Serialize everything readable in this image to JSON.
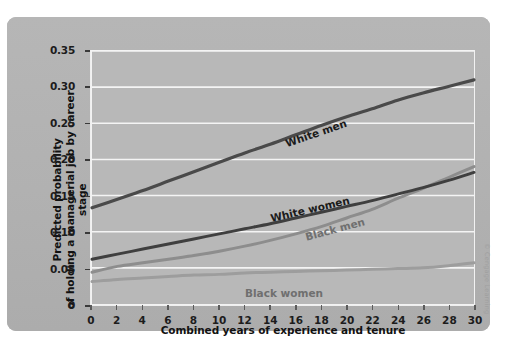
{
  "credit": "© Cengage Learning",
  "chart_data": {
    "type": "line",
    "title": "",
    "xlabel": "Combined years of experience and tenure",
    "ylabel": "Predicted probability\nof holding a managerial job by career stage",
    "ylabel_line1": "Predicted probability",
    "ylabel_line2": "of holding a managerial job by career stage",
    "xlim": [
      0,
      30
    ],
    "ylim": [
      0,
      0.35
    ],
    "grid": "horizontal",
    "legend_position": "inline-labels",
    "xticks": [
      0,
      2,
      4,
      6,
      8,
      10,
      12,
      14,
      16,
      18,
      20,
      22,
      24,
      26,
      28,
      30
    ],
    "xticklabels": [
      "0",
      "2",
      "4",
      "6",
      "8",
      "10",
      "12",
      "14",
      "16",
      "18",
      "20",
      "22",
      "24",
      "26",
      "28",
      "30"
    ],
    "yticks": [
      0,
      0.05,
      0.1,
      0.15,
      0.2,
      0.25,
      0.3,
      0.35
    ],
    "yticklabels": [
      "0",
      "0.05",
      "0.10",
      "0.15",
      "0.20",
      "0.25",
      "0.30",
      "0.35"
    ],
    "x": [
      0,
      2,
      4,
      6,
      8,
      10,
      12,
      14,
      16,
      18,
      20,
      22,
      24,
      26,
      28,
      30
    ],
    "series": [
      {
        "name": "White men",
        "color": "#4a4a4a",
        "width": 3.2,
        "values": [
          0.133,
          0.145,
          0.157,
          0.17,
          0.183,
          0.196,
          0.209,
          0.221,
          0.234,
          0.247,
          0.259,
          0.27,
          0.282,
          0.292,
          0.301,
          0.31
        ],
        "label_x": 17.5,
        "label_y": 0.238,
        "label_rotation": -19
      },
      {
        "name": "White women",
        "color": "#3f3f3f",
        "width": 3.0,
        "values": [
          0.062,
          0.069,
          0.076,
          0.083,
          0.09,
          0.097,
          0.104,
          0.111,
          0.119,
          0.127,
          0.135,
          0.143,
          0.152,
          0.161,
          0.171,
          0.182
        ],
        "label_x": 17.0,
        "label_y": 0.133,
        "label_rotation": -13
      },
      {
        "name": "Black men",
        "color": "#8d8d8d",
        "width": 3.0,
        "values": [
          0.044,
          0.052,
          0.057,
          0.062,
          0.067,
          0.073,
          0.08,
          0.088,
          0.097,
          0.107,
          0.119,
          0.131,
          0.146,
          0.16,
          0.175,
          0.19
        ],
        "label_x": 19.0,
        "label_y": 0.106,
        "label_rotation": -15
      },
      {
        "name": "Black women",
        "color": "#9d9d9d",
        "width": 3.0,
        "values": [
          0.031,
          0.034,
          0.036,
          0.038,
          0.04,
          0.041,
          0.043,
          0.044,
          0.045,
          0.046,
          0.047,
          0.048,
          0.049,
          0.05,
          0.053,
          0.057
        ],
        "label_x": 15.0,
        "label_y": 0.018,
        "label_rotation": 0
      }
    ]
  }
}
